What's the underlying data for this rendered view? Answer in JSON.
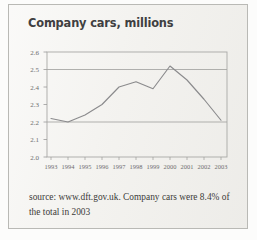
{
  "figure": {
    "title": "Company cars, millions",
    "caption": "source: www.dft.gov.uk. Company cars were 8.4% of the total in 2003",
    "colors": {
      "paper": "#f4f3f0",
      "border": "#b9b9b5",
      "title_text": "#3f3f41",
      "caption_text": "#3c3b39",
      "axis_line": "#9b9b99",
      "gridline": "#a3a3a1",
      "data_line": "#8b8b8d",
      "tick_label": "#6d6d6e"
    }
  },
  "chart_data": {
    "type": "line",
    "title": "Company cars, millions",
    "xlabel": "",
    "ylabel": "",
    "categories": [
      "1993",
      "1994",
      "1995",
      "1996",
      "1997",
      "1998",
      "1999",
      "2000",
      "2001",
      "2002",
      "2003"
    ],
    "values": [
      2.22,
      2.2,
      2.24,
      2.3,
      2.4,
      2.43,
      2.39,
      2.52,
      2.44,
      2.33,
      2.21
    ],
    "series": [
      {
        "name": "Company cars",
        "values": [
          2.22,
          2.2,
          2.24,
          2.3,
          2.4,
          2.43,
          2.39,
          2.52,
          2.44,
          2.33,
          2.21
        ]
      }
    ],
    "ylim": [
      2.0,
      2.6
    ],
    "ytick_labels": [
      "2.6",
      "2.5",
      "2.4",
      "2.3",
      "2.2",
      "2.1",
      "2.0"
    ],
    "ytick_values": [
      2.6,
      2.5,
      2.4,
      2.3,
      2.2,
      2.1,
      2.0
    ],
    "xtick_labels": [
      "1993",
      "1994",
      "1995",
      "1996",
      "1997",
      "1998",
      "1999",
      "2000",
      "2001",
      "2002",
      "2003"
    ],
    "gridlines_at": [
      2.5,
      2.2
    ],
    "grid": true,
    "legend": false,
    "legend_position": "none",
    "units": "millions"
  }
}
